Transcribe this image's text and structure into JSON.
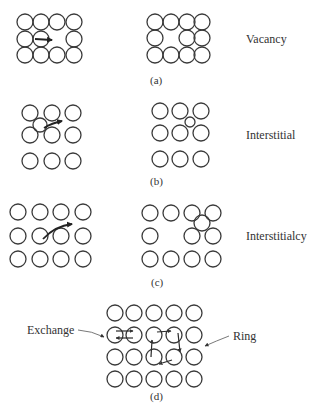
{
  "figure": {
    "panels": [
      {
        "id": "a",
        "caption": "(a)",
        "mechanism": "Vacancy",
        "atom_radius": 8,
        "before": {
          "xs": [
            25,
            41,
            57,
            74
          ],
          "ys": [
            22,
            39,
            55
          ],
          "missing": [
            [
              57,
              39
            ]
          ],
          "moving_atom": [
            41,
            39
          ],
          "arrow": {
            "from": [
              34,
              39
            ],
            "to": [
              52,
              40
            ]
          }
        },
        "after": {
          "xs": [
            155,
            171,
            187,
            202
          ],
          "ys": [
            22,
            38,
            55
          ],
          "missing": [
            [
              171,
              38
            ]
          ]
        }
      },
      {
        "id": "b",
        "caption": "(b)",
        "mechanism": "Interstitial",
        "atom_radius": 8,
        "before": {
          "xs": [
            30,
            52,
            73
          ],
          "ys": [
            113,
            135,
            161
          ],
          "interstitial": {
            "cx": 40,
            "cy": 125,
            "r": 7
          },
          "arrow": {
            "from": [
              44,
              128
            ],
            "to": [
              62,
              121
            ]
          }
        },
        "after": {
          "xs": [
            160,
            180,
            201
          ],
          "ys": [
            111,
            133,
            159
          ],
          "interstitial": {
            "cx": 190,
            "cy": 122,
            "r": 5
          }
        }
      },
      {
        "id": "c",
        "caption": "(c)",
        "mechanism": "Interstitialcy",
        "atom_radius": 8,
        "before": {
          "xs": [
            18,
            40,
            61,
            83
          ],
          "ys": [
            212,
            236,
            259
          ],
          "arrow": {
            "from": [
              43,
              238
            ],
            "to": [
              72,
              224
            ]
          }
        },
        "after": {
          "xs": [
            150,
            171,
            192,
            213
          ],
          "ys": [
            213,
            236,
            259
          ],
          "missing": [
            [
              171,
              236
            ]
          ],
          "interstitial": {
            "cx": 202,
            "cy": 223,
            "r": 8
          }
        }
      },
      {
        "id": "d",
        "caption": "(d)",
        "mechanisms": [
          "Exchange",
          "Ring"
        ],
        "atom_radius": 8,
        "grid": {
          "xs": [
            115,
            134,
            154,
            174,
            194
          ],
          "ys": [
            313,
            335,
            357,
            379
          ]
        }
      }
    ],
    "labels": {
      "vacancy": "Vacancy",
      "interstitial": "Interstitial",
      "interstitialcy": "Interstitialcy",
      "exchange": "Exchange",
      "ring": "Ring",
      "caption_a": "(a)",
      "caption_b": "(b)",
      "caption_c": "(c)",
      "caption_d": "(d)"
    },
    "colors": {
      "background": "#ffffff",
      "stroke": "#3a3a3a",
      "text": "#333333"
    }
  }
}
